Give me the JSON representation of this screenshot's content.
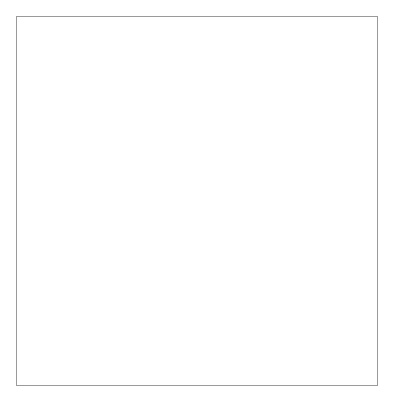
{
  "figure": {
    "background_color": "#ffffff",
    "frame_color": "#9a9a9a",
    "axis_color": "#6e6e6e",
    "bar_fill": "#ffffff",
    "bar_stroke": "#7a7a7a",
    "error_bar_color": "#8a8a8a"
  },
  "chart_data": {
    "type": "bar",
    "title": "",
    "xlabel": "",
    "ylabel": "[3H]-Thymidine incorporation (cpm)",
    "ylabel_parts": {
      "prefix": "[",
      "sup": "3",
      "suffix": "H]-Thymidine incorporation (cpm)"
    },
    "ylim": [
      0,
      60000
    ],
    "ytick_values": [
      0,
      10000,
      20000,
      30000,
      40000,
      50000,
      60000
    ],
    "ytick_labels": [
      "0",
      "10,000",
      "20,000",
      "30,000",
      "40,000",
      "50,000",
      "60,000"
    ],
    "minor_ticks_per_interval": 5,
    "grid": false,
    "legend": null,
    "categories": [
      "Concanavalin A (2 µg/ml)",
      "Ig-HA (100 nM)",
      "IgG-gal-HA (100 nM)",
      "IgG2b (100 nM)",
      "IgM-gal-HA (100 nM)",
      "IgM (100 nM)",
      "HA110–120 (1,000 nM)",
      "HA150–163 (1,000 nM)",
      "BHA (1.1 µg)"
    ],
    "values": [
      52000,
      40000,
      52000,
      900,
      41800,
      800,
      32400,
      600,
      55000
    ],
    "errors": [
      4200,
      7500,
      5200,
      300,
      2500,
      300,
      5000,
      200,
      3800
    ],
    "xtick_label_rotation_deg": -45
  }
}
